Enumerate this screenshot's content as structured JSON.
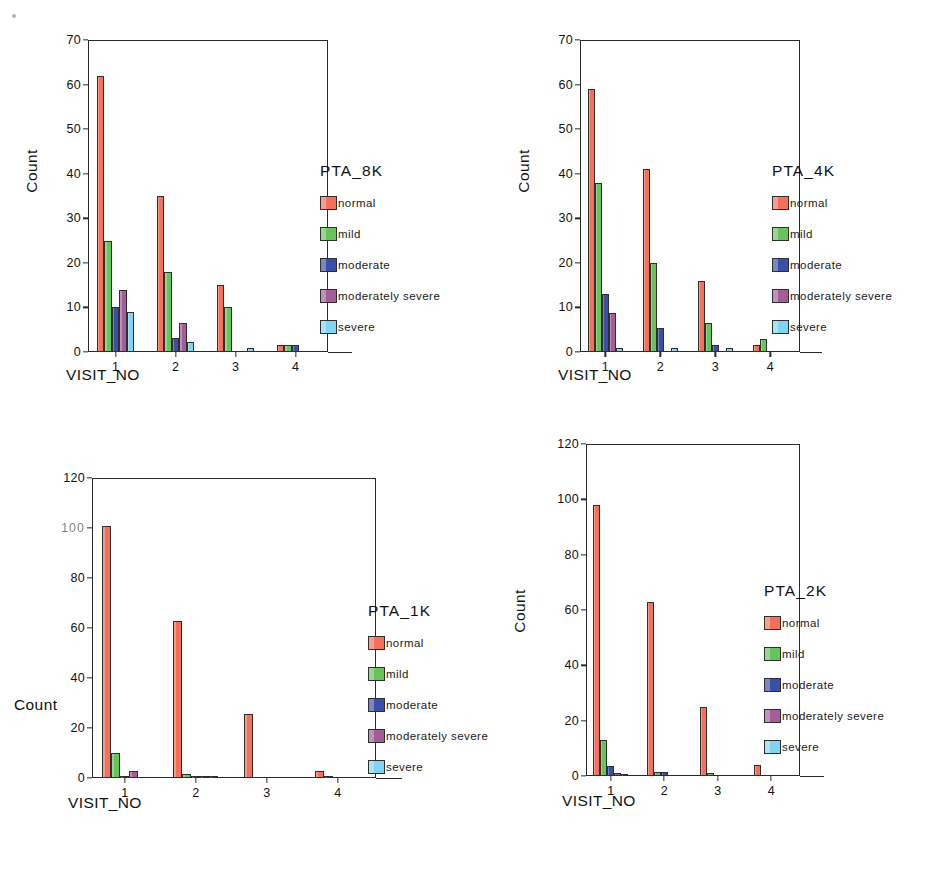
{
  "figure": {
    "background": "#ffffff",
    "artifact": "scan-speck"
  },
  "series_colors": {
    "normal": "#F4705A",
    "mild": "#66C45B",
    "moderate": "#3A4FA8",
    "moderately severe": "#A35E9A",
    "severe": "#7FD6F2"
  },
  "legend_labels": [
    "normal",
    "mild",
    "moderate",
    "moderately severe",
    "severe"
  ],
  "chart_data": [
    {
      "type": "bar",
      "id": "pta8k",
      "title": "",
      "legend_title": "PTA_8K",
      "legend_position": "right",
      "xlabel": "VISIT_NO",
      "ylabel": "Count",
      "ylabel_orientation": "vertical",
      "categories": [
        "1",
        "2",
        "3",
        "4"
      ],
      "ylim": [
        0,
        70
      ],
      "yticks": [
        0,
        10,
        20,
        30,
        40,
        50,
        60,
        70
      ],
      "grid": false,
      "series": [
        {
          "name": "normal",
          "values": [
            62,
            35,
            15,
            1.5
          ]
        },
        {
          "name": "mild",
          "values": [
            25,
            18,
            10,
            1.5
          ]
        },
        {
          "name": "moderate",
          "values": [
            10,
            3.2,
            0,
            1.5
          ]
        },
        {
          "name": "moderately severe",
          "values": [
            14,
            6.5,
            0,
            0
          ]
        },
        {
          "name": "severe",
          "values": [
            9,
            2.3,
            0.8,
            0
          ]
        }
      ]
    },
    {
      "type": "bar",
      "id": "pta4k",
      "title": "",
      "legend_title": "PTA_4K",
      "legend_position": "right",
      "xlabel": "VISIT_NO",
      "ylabel": "Count",
      "ylabel_orientation": "vertical",
      "categories": [
        "1",
        "2",
        "3",
        "4"
      ],
      "ylim": [
        0,
        70
      ],
      "yticks": [
        0,
        10,
        20,
        30,
        40,
        50,
        60,
        70
      ],
      "grid": false,
      "series": [
        {
          "name": "normal",
          "values": [
            59,
            41,
            16,
            1.5
          ]
        },
        {
          "name": "mild",
          "values": [
            38,
            20,
            6.5,
            3
          ]
        },
        {
          "name": "moderate",
          "values": [
            13,
            5.5,
            1.5,
            0
          ]
        },
        {
          "name": "moderately severe",
          "values": [
            8.8,
            0,
            0,
            0
          ]
        },
        {
          "name": "severe",
          "values": [
            0.8,
            0.8,
            0.8,
            0
          ]
        }
      ]
    },
    {
      "type": "bar",
      "id": "pta1k",
      "title": "",
      "legend_title": "PTA_1K",
      "legend_position": "right",
      "xlabel": "VISIT_NO",
      "ylabel": "Count",
      "ylabel_orientation": "horizontal",
      "categories": [
        "1",
        "2",
        "3",
        "4"
      ],
      "ylim": [
        0,
        120
      ],
      "yticks": [
        0,
        20,
        40,
        60,
        80,
        100,
        120
      ],
      "ytick_labels": [
        "0",
        "20",
        "40",
        "60",
        "80",
        "100",
        "120"
      ],
      "grid": false,
      "series": [
        {
          "name": "normal",
          "values": [
            101,
            63,
            25.5,
            3
          ]
        },
        {
          "name": "mild",
          "values": [
            10,
            1.5,
            0,
            0.8
          ]
        },
        {
          "name": "moderate",
          "values": [
            0.6,
            0.6,
            0,
            0
          ]
        },
        {
          "name": "moderately severe",
          "values": [
            3,
            0.6,
            0,
            0
          ]
        },
        {
          "name": "severe",
          "values": [
            0,
            0.8,
            0,
            0
          ]
        }
      ]
    },
    {
      "type": "bar",
      "id": "pta2k",
      "title": "",
      "legend_title": "PTA_2K",
      "legend_position": "right",
      "xlabel": "VISIT_NO",
      "ylabel": "Count",
      "ylabel_orientation": "vertical",
      "categories": [
        "1",
        "2",
        "3",
        "4"
      ],
      "ylim": [
        0,
        120
      ],
      "yticks": [
        0,
        20,
        40,
        60,
        80,
        100,
        120
      ],
      "grid": false,
      "series": [
        {
          "name": "normal",
          "values": [
            98,
            63,
            25,
            4
          ]
        },
        {
          "name": "mild",
          "values": [
            13,
            1.5,
            1.2,
            0
          ]
        },
        {
          "name": "moderate",
          "values": [
            3.5,
            1.5,
            0,
            0
          ]
        },
        {
          "name": "moderately severe",
          "values": [
            1.2,
            0,
            0,
            0
          ]
        },
        {
          "name": "severe",
          "values": [
            0.8,
            0,
            0,
            0
          ]
        }
      ]
    }
  ]
}
